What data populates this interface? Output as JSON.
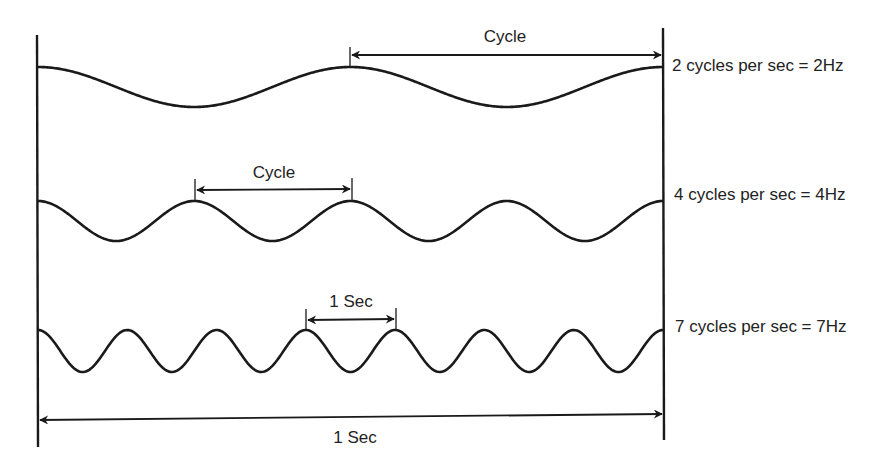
{
  "diagram": {
    "colors": {
      "ink": "#1a1a1a",
      "background": "#ffffff"
    },
    "frame": {
      "left_x": 37,
      "right_x": 663
    },
    "waves": [
      {
        "id": "wave-2hz",
        "cycles": 2,
        "label": "2 cycles per sec = 2Hz",
        "center_y": 87,
        "amplitude": 20,
        "annotation": {
          "text": "Cycle",
          "from_x": 350,
          "to_x": 662,
          "arrow_y": 55,
          "style": "single-right"
        }
      },
      {
        "id": "wave-4hz",
        "cycles": 4,
        "label": "4 cycles per sec = 4Hz",
        "center_y": 221,
        "amplitude": 20,
        "annotation": {
          "text": "Cycle",
          "from_x": 195,
          "to_x": 352,
          "arrow_y": 190,
          "style": "double"
        }
      },
      {
        "id": "wave-7hz",
        "cycles": 7,
        "label": "7 cycles per sec = 7Hz",
        "center_y": 351,
        "amplitude": 21,
        "annotation": {
          "text": "1 Sec",
          "from_x": 306,
          "to_x": 396,
          "arrow_y": 319,
          "style": "double"
        }
      }
    ],
    "timeline": {
      "text": "1 Sec",
      "arrow_y": 419
    }
  }
}
